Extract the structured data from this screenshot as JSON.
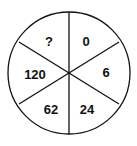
{
  "puzzle": {
    "type": "number-wheel",
    "segments": [
      {
        "position": "top-left",
        "value": "?"
      },
      {
        "position": "top-right",
        "value": "0"
      },
      {
        "position": "right",
        "value": "6"
      },
      {
        "position": "bottom-right",
        "value": "24"
      },
      {
        "position": "bottom-left",
        "value": "62"
      },
      {
        "position": "left",
        "value": "120"
      }
    ],
    "colors": {
      "stroke": "#111111",
      "background": "#ffffff"
    }
  }
}
